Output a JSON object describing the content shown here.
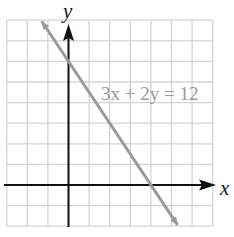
{
  "chart_data": {
    "type": "line",
    "title": "",
    "xlabel": "x",
    "ylabel": "y",
    "xlim": [
      -3,
      7
    ],
    "ylim": [
      -2,
      8
    ],
    "grid": true,
    "grid_step": 1,
    "tick_labels_shown": false,
    "series": [
      {
        "name": "3x + 2y = 12",
        "equation": "3x + 2y = 12",
        "slope": -1.5,
        "y_intercept": 6,
        "x_intercept": 4,
        "x": [
          -1.3,
          5.3
        ],
        "y": [
          7.95,
          -1.95
        ],
        "color": "#9a9a9a"
      }
    ],
    "annotations": [
      {
        "text": "3x + 2y = 12",
        "x": 1.5,
        "y": 4.4
      }
    ]
  },
  "axes": {
    "x_label": "x",
    "y_label": "y",
    "axis_color": "#111111",
    "grid_color": "#d4d4d4"
  },
  "equation_label": "3x + 2y = 12"
}
